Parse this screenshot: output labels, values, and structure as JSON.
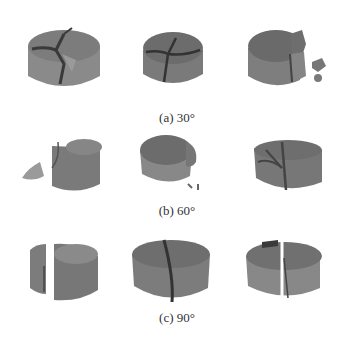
{
  "figure": {
    "rows": [
      {
        "caption": "(a) 30°",
        "angle": "30°",
        "specimens": [
          {
            "id": 1,
            "description": "cylinder fractured into multiple wedge pieces, Y-shaped crack on top"
          },
          {
            "id": 2,
            "description": "cylinder with Y-shaped radial cracks on top face"
          },
          {
            "id": 3,
            "description": "cylinder with broken fragments, debris to the right"
          }
        ]
      },
      {
        "caption": "(b) 60°",
        "angle": "60°",
        "specimens": [
          {
            "id": 1,
            "description": "cylinder with detached wedge fragment on left"
          },
          {
            "id": 2,
            "description": "cylinder with small chipped fragment on right side"
          },
          {
            "id": 3,
            "description": "cylinder split into several pieces with central crack"
          }
        ]
      },
      {
        "caption": "(c) 90°",
        "angle": "90°",
        "specimens": [
          {
            "id": 1,
            "description": "cylinder split vertically into two halves, offset"
          },
          {
            "id": 2,
            "description": "cylinder split along diagonal vertical crack"
          },
          {
            "id": 3,
            "description": "cylinder split vertically into two halves"
          }
        ]
      }
    ],
    "colors": {
      "background": "#ffffff",
      "specimen_top": "#7a7a7a",
      "specimen_side": "#8c8c8c",
      "crack": "#3a3a3a",
      "caption_text": "#333333"
    }
  }
}
